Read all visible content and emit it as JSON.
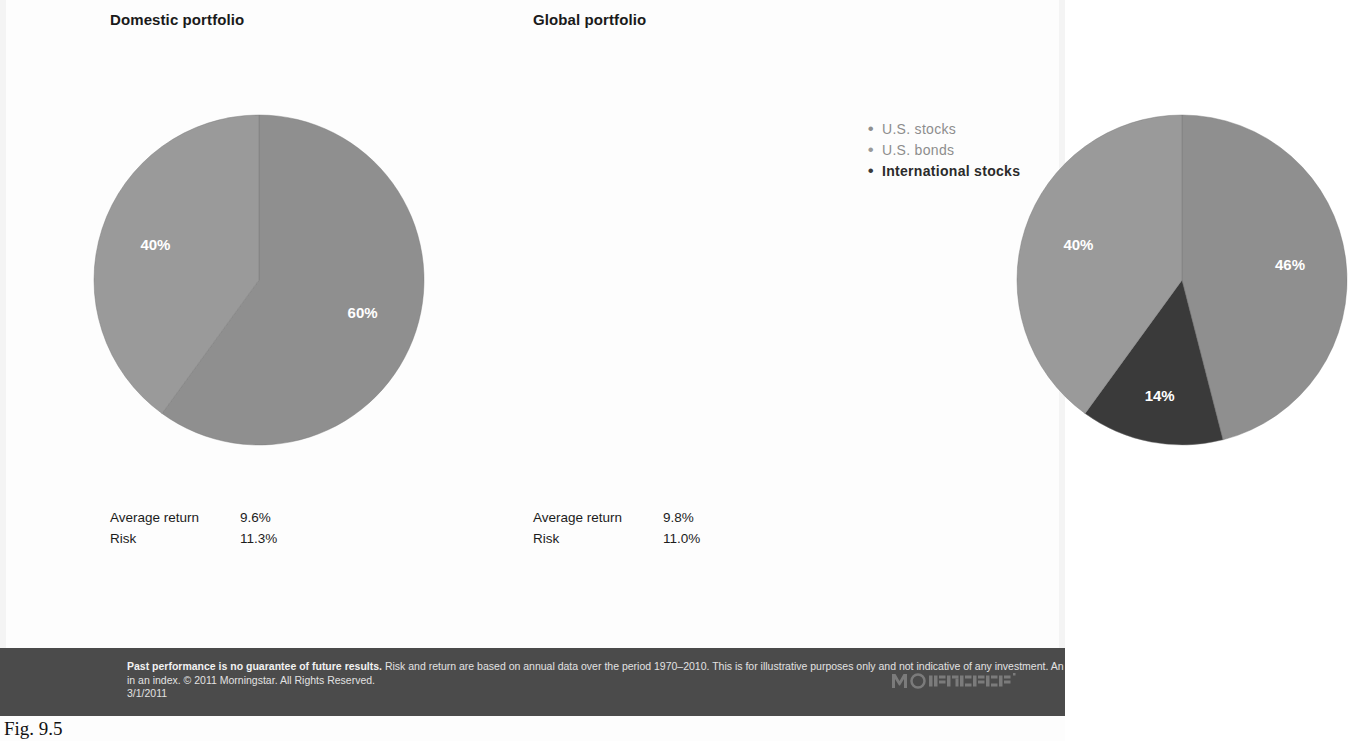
{
  "figure": {
    "caption": "Fig. 9.5",
    "background_color": "#fdfdfd"
  },
  "panels": [
    {
      "id": "domestic",
      "title": "Domestic portfolio",
      "stats": [
        {
          "label": "Average return",
          "value": "9.6%"
        },
        {
          "label": "Risk",
          "value": "11.3%"
        }
      ]
    },
    {
      "id": "global",
      "title": "Global portfolio",
      "stats": [
        {
          "label": "Average return",
          "value": "9.8%"
        },
        {
          "label": "Risk",
          "value": "11.0%"
        }
      ]
    }
  ],
  "legend": {
    "position": "top-right",
    "items": [
      {
        "label": "U.S. stocks",
        "color": "#8f8f8f",
        "text_color": "#8d8d8d"
      },
      {
        "label": "U.S. bonds",
        "color": "#9a9a9a",
        "text_color": "#8d8d8d"
      },
      {
        "label": "International stocks",
        "color": "#3a3a3a",
        "text_color": "#2b2b2b"
      }
    ]
  },
  "footer": {
    "lead": "Past performance is no guarantee of future results.",
    "body": " Risk and return are based on annual data over the period 1970–2010. This is for illustrative purposes only and not indicative of any investment. An investment cannot be made directly in an index. © 2011 Morningstar. All Rights Reserved.",
    "date": "3/1/2011",
    "logo_text": "MORNINGSTAR",
    "background_color": "#4b4b4b"
  },
  "chart_data": [
    {
      "type": "pie",
      "title": "Domestic portfolio",
      "labels": [
        "U.S. stocks",
        "U.S. bonds"
      ],
      "values": [
        60,
        40
      ],
      "value_labels": [
        "60%",
        "40%"
      ],
      "colors": [
        "#8f8f8f",
        "#9a9a9a"
      ],
      "start_angle_deg": 0,
      "direction": "clockwise",
      "legend": "shared",
      "annotations": {
        "Average return": "9.6%",
        "Risk": "11.3%"
      }
    },
    {
      "type": "pie",
      "title": "Global portfolio",
      "labels": [
        "U.S. stocks",
        "International stocks",
        "U.S. bonds"
      ],
      "values": [
        46,
        14,
        40
      ],
      "value_labels": [
        "46%",
        "14%",
        "40%"
      ],
      "colors": [
        "#8f8f8f",
        "#3a3a3a",
        "#9a9a9a"
      ],
      "start_angle_deg": 0,
      "direction": "clockwise",
      "legend": "shared",
      "annotations": {
        "Average return": "9.8%",
        "Risk": "11.0%"
      }
    }
  ]
}
